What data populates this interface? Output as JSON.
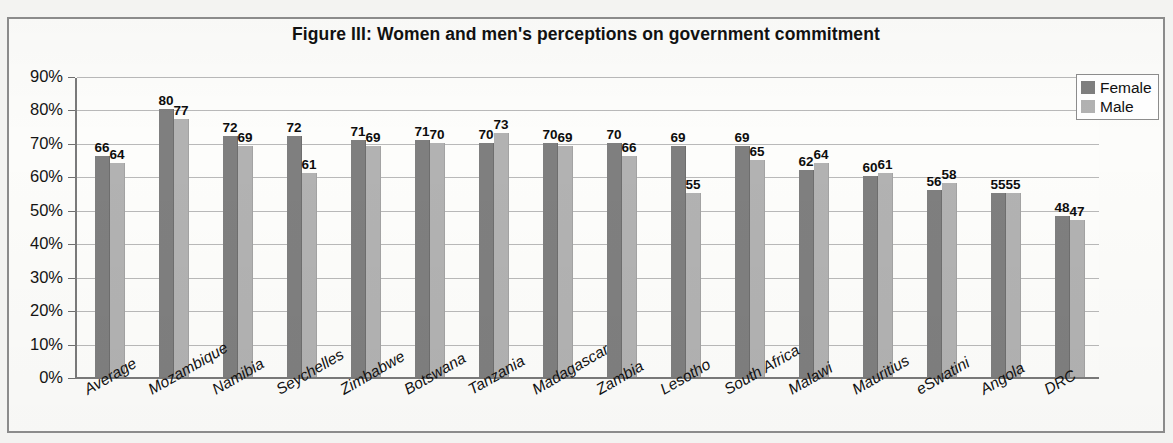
{
  "figure": {
    "title": "Figure III: Women and men's perceptions on government commitment"
  },
  "legend": {
    "position": "top-right",
    "items": [
      {
        "label": "Female",
        "color": "#7f7f7f"
      },
      {
        "label": "Male",
        "color": "#b2b2b2"
      }
    ]
  },
  "axis": {
    "y_ticks": [
      "0%",
      "10%",
      "20%",
      "30%",
      "40%",
      "50%",
      "60%",
      "70%",
      "80%",
      "90%"
    ]
  },
  "chart_data": {
    "type": "bar",
    "title": "Figure III: Women and men's perceptions on government commitment",
    "xlabel": "",
    "ylabel": "",
    "ylim": [
      0,
      90
    ],
    "ytick_labels": [
      "0%",
      "10%",
      "20%",
      "30%",
      "40%",
      "50%",
      "60%",
      "70%",
      "80%",
      "90%"
    ],
    "grid": true,
    "legend_position": "top-right",
    "value_labels": true,
    "categories": [
      "Average",
      "Mozambique",
      "Namibia",
      "Seychelles",
      "Zimbabwe",
      "Botswana",
      "Tanzania",
      "Madagascar",
      "Zambia",
      "Lesotho",
      "South Africa",
      "Malawi",
      "Mauritius",
      "eSwatini",
      "Angola",
      "DRC"
    ],
    "series": [
      {
        "name": "Female",
        "color": "#7f7f7f",
        "values": [
          66,
          80,
          72,
          72,
          71,
          71,
          70,
          70,
          70,
          69,
          69,
          62,
          60,
          56,
          55,
          48
        ]
      },
      {
        "name": "Male",
        "color": "#b2b2b2",
        "values": [
          64,
          77,
          69,
          61,
          69,
          70,
          73,
          69,
          66,
          55,
          65,
          64,
          61,
          58,
          55,
          47
        ]
      }
    ]
  }
}
